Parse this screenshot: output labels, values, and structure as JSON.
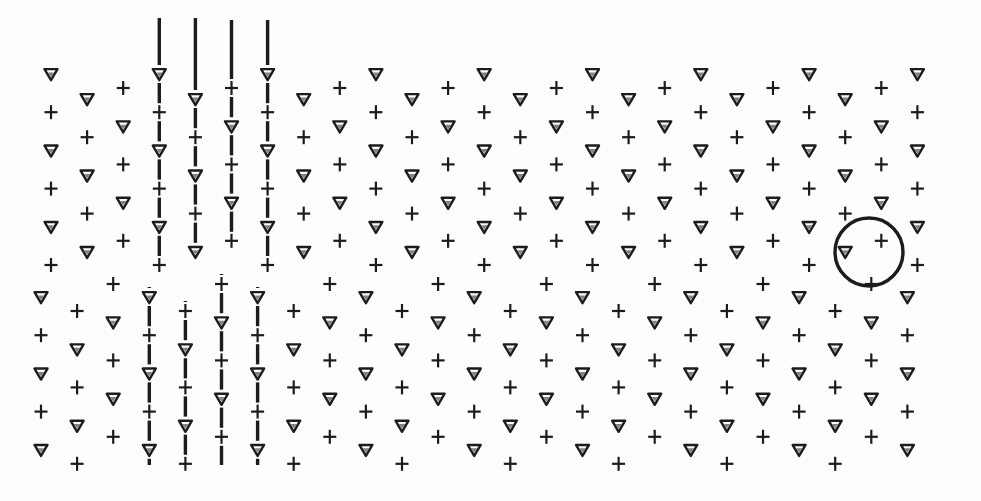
{
  "diagram": {
    "title": "",
    "ink_color": "#1c1c1c",
    "paper_color": "#fdfdfc",
    "symbols": {
      "triangle": "▽",
      "plus": "+"
    },
    "arrays": [
      {
        "name": "upper-array",
        "columns": 25,
        "phase_patterns": [
          [
            "triangle",
            "plus",
            "triangle",
            "plus",
            "triangle",
            "plus"
          ],
          [
            "triangle",
            "plus",
            "triangle",
            "plus",
            "triangle"
          ],
          [
            "plus",
            "triangle",
            "plus",
            "triangle",
            "plus"
          ]
        ],
        "lined_columns": [
          3,
          4,
          5,
          6
        ]
      },
      {
        "name": "lower-array",
        "columns": 25,
        "phase_patterns": [
          [
            "triangle",
            "plus",
            "triangle",
            "plus",
            "triangle"
          ],
          [
            "plus",
            "triangle",
            "plus",
            "triangle",
            "plus"
          ],
          [
            "plus",
            "triangle",
            "plus",
            "triangle",
            "plus"
          ]
        ],
        "lined_columns": [
          3,
          4,
          5,
          6
        ]
      }
    ],
    "highlight": {
      "name": "circled-cluster",
      "array": "upper-array",
      "contains": [
        "triangle",
        "plus",
        "plus"
      ]
    }
  }
}
